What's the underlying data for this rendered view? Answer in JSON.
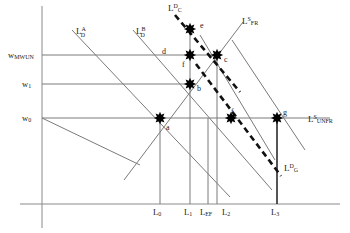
{
  "figure": {
    "type": "economics-labor-market-diagram",
    "background": "#ffffff",
    "line_color": "#7a7a7a",
    "dashed_color": "#111111",
    "point_color": "#000000",
    "text_color": "#1a1a1a"
  },
  "axes": {
    "y_axis_name": "wage-axis",
    "x_axis_name": "labor-axis",
    "y_labels": [
      {
        "id": "w_mwun",
        "base": "w",
        "sub": "MWUN",
        "sup": "",
        "x": 8,
        "y": 51
      },
      {
        "id": "w_1",
        "base": "w",
        "sub": "1",
        "sup": "",
        "x": 22,
        "y": 80
      },
      {
        "id": "w_0",
        "base": "w",
        "sub": "0",
        "sup": "",
        "x": 22,
        "y": 114
      }
    ],
    "x_labels": [
      {
        "id": "l_0",
        "base": "L",
        "sub": "0",
        "sup": "",
        "x": 153,
        "y": 208
      },
      {
        "id": "l_1",
        "base": "L",
        "sub": "1",
        "sup": "",
        "x": 184,
        "y": 208
      },
      {
        "id": "l_ef",
        "base": "L",
        "sub": "EF",
        "sup": "",
        "x": 200,
        "y": 208
      },
      {
        "id": "l_2",
        "base": "L",
        "sub": "2",
        "sup": "",
        "x": 222,
        "y": 208
      },
      {
        "id": "l_3",
        "base": "L",
        "sub": "3",
        "sup": "",
        "x": 271,
        "y": 208
      }
    ]
  },
  "curve_labels": [
    {
      "id": "ld_a",
      "base": "L",
      "sub": "D",
      "sup": "A",
      "x": 76,
      "y": 24,
      "stacked": true
    },
    {
      "id": "ld_b",
      "base": "L",
      "sub": "D",
      "sup": "B",
      "x": 136,
      "y": 24,
      "stacked": true
    },
    {
      "id": "lc_d",
      "base": "L",
      "sub": "C",
      "sup": "D",
      "x": 168,
      "y": 3,
      "stacked": false
    },
    {
      "id": "ls_fr",
      "base": "L",
      "sub": "FR",
      "sup": "S",
      "x": 242,
      "y": 16,
      "stacked": false
    },
    {
      "id": "ls_unfr",
      "base": "L",
      "sub": "UNFR",
      "sup": "S",
      "x": 308,
      "y": 114,
      "stacked": false
    },
    {
      "id": "lg_d",
      "base": "L",
      "sub": "G",
      "sup": "D",
      "x": 284,
      "y": 163,
      "stacked": false
    }
  ],
  "points": [
    {
      "id": "a",
      "label": "a",
      "cx": 160,
      "cy": 118,
      "lx": 166,
      "ly": 124
    },
    {
      "id": "b",
      "label": "b",
      "cx": 190,
      "cy": 84,
      "lx": 197,
      "ly": 85
    },
    {
      "id": "c",
      "label": "c",
      "cx": 217,
      "cy": 55,
      "lx": 224,
      "ly": 56
    },
    {
      "id": "d",
      "label": "d",
      "cx": null,
      "cy": null,
      "lx": 162,
      "ly": 48
    },
    {
      "id": "e",
      "label": "e",
      "cx": 190,
      "cy": 29,
      "lx": 200,
      "ly": 22
    },
    {
      "id": "f1",
      "label": "f",
      "cx": 190,
      "cy": 55,
      "lx": 182,
      "ly": 61
    },
    {
      "id": "f2",
      "label": "f",
      "cx": 231,
      "cy": 118,
      "lx": 231,
      "ly": 108
    },
    {
      "id": "g",
      "label": "g",
      "cx": 277,
      "cy": 118,
      "lx": 283,
      "ly": 109
    }
  ],
  "horizontal_wage_lines": [
    {
      "id": "line_w_mwun",
      "y": 55,
      "x1": 42,
      "x2": 222
    },
    {
      "id": "line_w_1",
      "y": 84,
      "x1": 42,
      "x2": 195
    },
    {
      "id": "line_w_0",
      "y": 118,
      "x1": 42,
      "x2": 330
    }
  ],
  "vertical_gridlines": [
    {
      "id": "grid_l_0",
      "x": 160,
      "y1": 118,
      "y2": 204
    },
    {
      "id": "grid_l_1",
      "x": 190,
      "y1": 29,
      "y2": 204
    },
    {
      "id": "grid_l_ef",
      "x": 208,
      "y1": 118,
      "y2": 204
    },
    {
      "id": "grid_l_2",
      "x": 217,
      "y1": 55,
      "y2": 204
    },
    {
      "id": "grid_l_3",
      "x": 277,
      "y1": 118,
      "y2": 204
    }
  ],
  "solid_curves": [
    {
      "id": "curve_ld_a",
      "x1": 72,
      "y1": 30,
      "x2": 230,
      "y2": 197
    },
    {
      "id": "curve_ld_b",
      "x1": 133,
      "y1": 30,
      "x2": 272,
      "y2": 190
    },
    {
      "id": "curve_ls_fr",
      "x1": 124,
      "y1": 180,
      "x2": 243,
      "y2": 22
    },
    {
      "id": "curve_right_fan_1",
      "x1": 200,
      "y1": 35,
      "x2": 275,
      "y2": 160
    },
    {
      "id": "curve_right_fan_2",
      "x1": 232,
      "y1": 40,
      "x2": 305,
      "y2": 150
    },
    {
      "id": "curve_lower_left",
      "x1": 42,
      "y1": 118,
      "x2": 140,
      "y2": 165
    }
  ],
  "dashed_curves": [
    {
      "id": "curve_lc_d",
      "x1": 175,
      "y1": 15,
      "x2": 240,
      "y2": 92
    },
    {
      "id": "curve_lg_d",
      "x1": 196,
      "y1": 64,
      "x2": 281,
      "y2": 176
    }
  ]
}
